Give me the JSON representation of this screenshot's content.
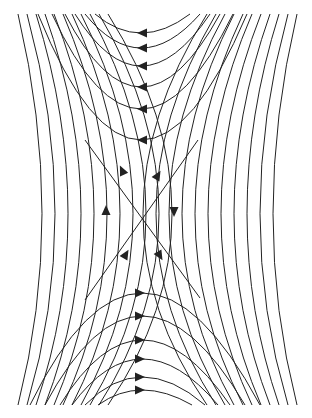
{
  "diagram": {
    "type": "phase-portrait-saddle",
    "stroke_color": "#222222",
    "background": "#ffffff",
    "center": [
      140,
      218
    ],
    "top_arrow_ys": [
      33,
      48,
      66,
      87,
      109,
      140
    ],
    "bottom_arrow_ys": [
      293,
      316,
      340,
      359,
      377,
      390
    ],
    "side_curve_count": 11
  }
}
